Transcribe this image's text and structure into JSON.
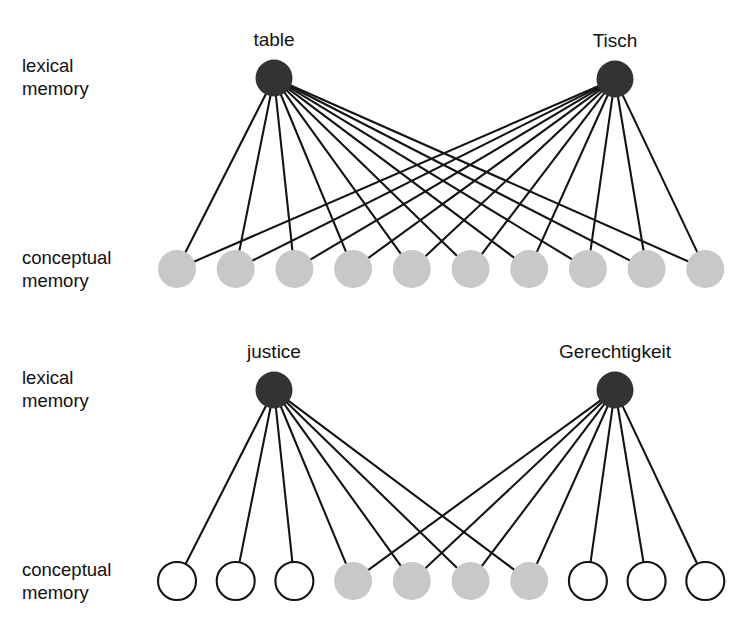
{
  "figure": {
    "background_color": "#ffffff",
    "lexical_node_color": "#333333",
    "concept_shared_color": "#c8c8c8",
    "concept_unshared_color": "#ffffff",
    "concept_outline_color": "#141414",
    "edge_color": "#141414"
  },
  "panels": [
    {
      "id": "concrete-noun-panel",
      "row_labels": {
        "lexical": "lexical\nmemory",
        "lexical_line1": "lexical",
        "lexical_line2": "memory",
        "conceptual_line1": "conceptual",
        "conceptual_line2": "memory"
      },
      "lexical_nodes": [
        {
          "id": "table",
          "label": "table",
          "cx": 274,
          "cy": 78,
          "r": 18.5,
          "color": "#333333"
        },
        {
          "id": "tisch",
          "label": "Tisch",
          "cx": 615,
          "cy": 79,
          "r": 18.5,
          "color": "#333333"
        }
      ],
      "conceptual_row": {
        "cy": 269,
        "r": 19,
        "x_start": 177,
        "x_spacing": 58.7,
        "count": 10,
        "nodes": [
          {
            "index": 0,
            "filled": true
          },
          {
            "index": 1,
            "filled": true
          },
          {
            "index": 2,
            "filled": true
          },
          {
            "index": 3,
            "filled": true
          },
          {
            "index": 4,
            "filled": true
          },
          {
            "index": 5,
            "filled": true
          },
          {
            "index": 6,
            "filled": true
          },
          {
            "index": 7,
            "filled": true
          },
          {
            "index": 8,
            "filled": true
          },
          {
            "index": 9,
            "filled": true
          }
        ]
      },
      "edges": {
        "table": [
          0,
          1,
          2,
          3,
          4,
          5,
          6,
          7,
          8,
          9
        ],
        "tisch": [
          0,
          1,
          2,
          3,
          4,
          5,
          6,
          7,
          8,
          9
        ]
      },
      "label_positions": {
        "lexical_x": 22,
        "lexical_y1": 72,
        "lexical_y2": 95,
        "conceptual_x": 22,
        "conceptual_y1": 264,
        "conceptual_y2": 287
      }
    },
    {
      "id": "abstract-noun-panel",
      "row_labels": {
        "lexical_line1": "lexical",
        "lexical_line2": "memory",
        "conceptual_line1": "conceptual",
        "conceptual_line2": "memory"
      },
      "lexical_nodes": [
        {
          "id": "justice",
          "label": "justice",
          "cx": 274,
          "cy": 390,
          "r": 18.5,
          "color": "#333333"
        },
        {
          "id": "gerechtigkeit",
          "label": "Gerechtigkeit",
          "cx": 615,
          "cy": 390,
          "r": 18.5,
          "color": "#333333"
        }
      ],
      "conceptual_row": {
        "cy": 581,
        "r": 19,
        "x_start": 177,
        "x_spacing": 58.7,
        "count": 10,
        "nodes": [
          {
            "index": 0,
            "filled": false
          },
          {
            "index": 1,
            "filled": false
          },
          {
            "index": 2,
            "filled": false
          },
          {
            "index": 3,
            "filled": true
          },
          {
            "index": 4,
            "filled": true
          },
          {
            "index": 5,
            "filled": true
          },
          {
            "index": 6,
            "filled": true
          },
          {
            "index": 7,
            "filled": false
          },
          {
            "index": 8,
            "filled": false
          },
          {
            "index": 9,
            "filled": false
          }
        ]
      },
      "edges": {
        "justice": [
          0,
          1,
          2,
          3,
          4,
          5,
          6
        ],
        "gerechtigkeit": [
          3,
          4,
          5,
          6,
          7,
          8,
          9
        ]
      },
      "label_positions": {
        "lexical_x": 22,
        "lexical_y1": 384,
        "lexical_y2": 407,
        "conceptual_x": 22,
        "conceptual_y1": 576,
        "conceptual_y2": 599
      }
    }
  ]
}
